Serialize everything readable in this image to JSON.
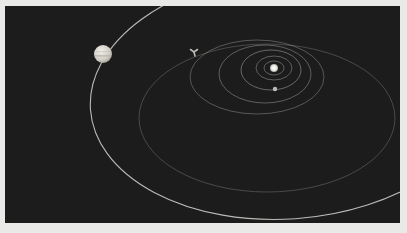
{
  "scene": {
    "title": "",
    "background_color": "#1c1c1c",
    "border_color": "#e9e9e7",
    "sun": {
      "label": "sun",
      "cx": 269,
      "cy": 62,
      "r": 4,
      "color": "#f4f4f0"
    },
    "planets": [
      {
        "label": "gas-giant-planet",
        "cx": 98,
        "cy": 48,
        "r": 9,
        "color": "#d8d6cf"
      },
      {
        "label": "small-planet",
        "cx": 270,
        "cy": 83,
        "r": 2.2,
        "color": "#bdbdb8"
      }
    ],
    "spacecraft": {
      "label": "spacecraft",
      "x": 189,
      "y": 46,
      "color": "#b8b8b4"
    },
    "orbits": [
      {
        "name": "orbit-1",
        "cx": 269,
        "cy": 62,
        "rx": 10,
        "ry": 7,
        "opacity": 0.45
      },
      {
        "name": "orbit-2",
        "cx": 269,
        "cy": 62,
        "rx": 18,
        "ry": 12,
        "opacity": 0.45
      },
      {
        "name": "orbit-3",
        "cx": 266,
        "cy": 64,
        "rx": 30,
        "ry": 20,
        "opacity": 0.5
      },
      {
        "name": "orbit-4",
        "cx": 260,
        "cy": 68,
        "rx": 46,
        "ry": 29,
        "opacity": 0.45
      },
      {
        "name": "orbit-5",
        "cx": 252,
        "cy": 71,
        "rx": 67,
        "ry": 37,
        "opacity": 0.4
      },
      {
        "name": "transfer-orbit",
        "cx": 262,
        "cy": 112,
        "rx": 128,
        "ry": 74,
        "opacity": 0.3
      },
      {
        "name": "outer-planet-orbit",
        "cx": 282,
        "cy": 90,
        "rx": 197,
        "ry": 123,
        "opacity": 0.85
      }
    ]
  }
}
